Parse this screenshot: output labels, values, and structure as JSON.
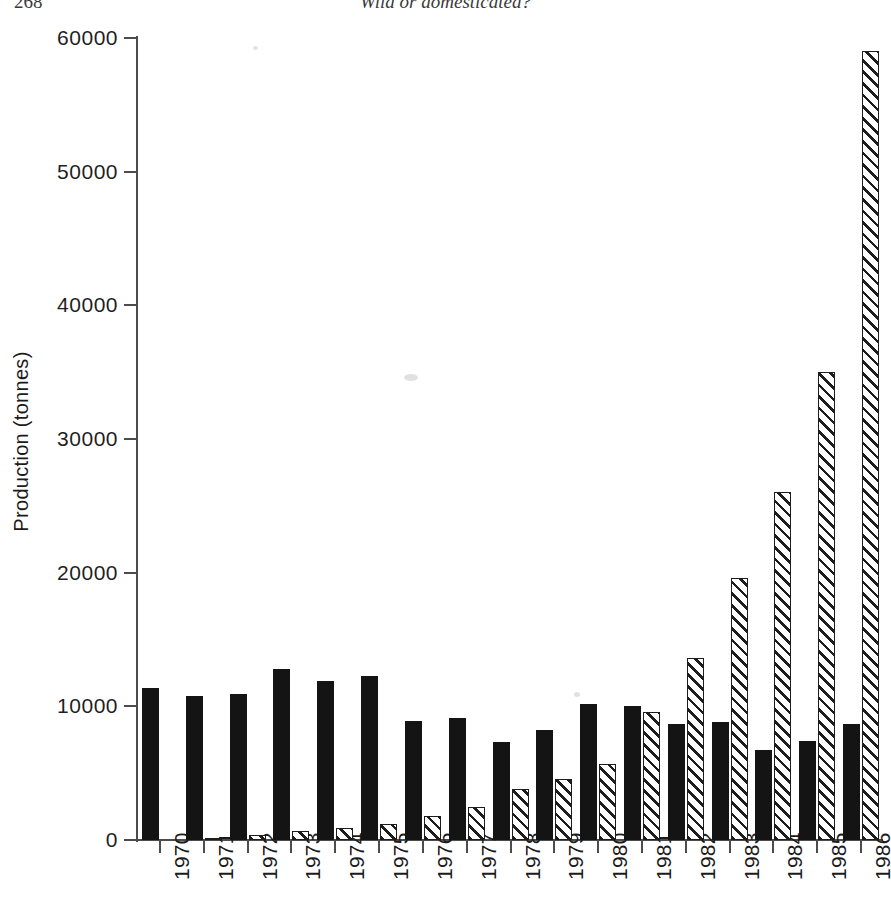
{
  "page": {
    "number": "268",
    "running_head": "Wild or domesticated?"
  },
  "chart_data": {
    "type": "bar",
    "title": "",
    "xlabel": "",
    "ylabel": "Production (tonnes)",
    "ylim": [
      0,
      60000
    ],
    "ytick_labels": [
      "0",
      "10000",
      "20000",
      "30000",
      "40000",
      "50000",
      "60000"
    ],
    "yticks": [
      0,
      10000,
      20000,
      30000,
      40000,
      50000,
      60000
    ],
    "grid": false,
    "legend": "none",
    "categories": [
      "1970",
      "1971",
      "1972",
      "1973",
      "1974",
      "1975",
      "1976",
      "1977",
      "1978",
      "1979",
      "1980",
      "1981",
      "1982",
      "1983",
      "1984",
      "1985",
      "1986"
    ],
    "series": [
      {
        "name": "wild",
        "fill": "solid-black",
        "values": [
          11400,
          10800,
          10900,
          12800,
          11900,
          12300,
          8900,
          9100,
          7300,
          8200,
          10200,
          10000,
          8700,
          8800,
          6700,
          7400,
          8700
        ]
      },
      {
        "name": "cultured",
        "fill": "diagonal-hatch",
        "values": [
          0,
          100,
          400,
          700,
          900,
          1200,
          1800,
          2500,
          3800,
          4600,
          5700,
          9600,
          13600,
          19600,
          26000,
          35000,
          59000
        ]
      }
    ]
  }
}
